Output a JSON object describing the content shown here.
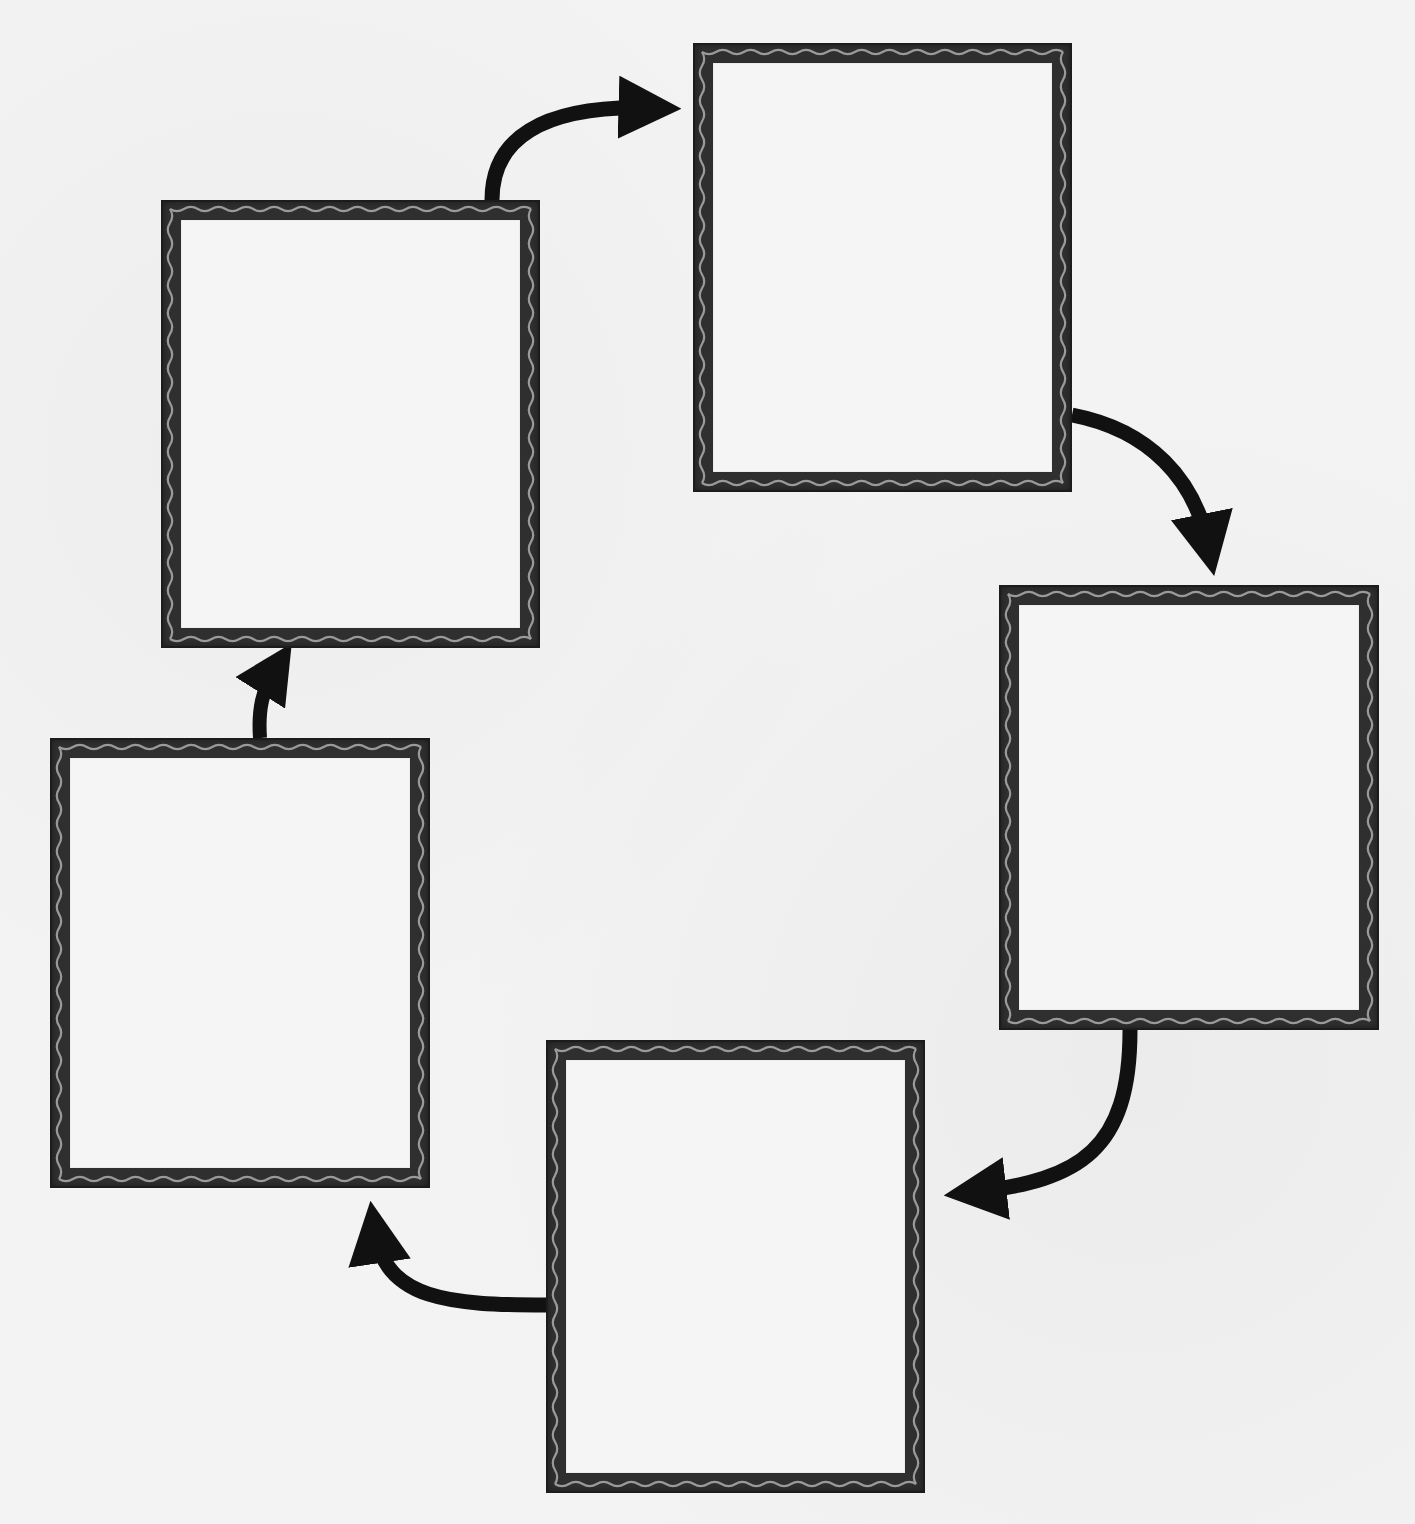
{
  "diagram": {
    "type": "cycle",
    "colors": {
      "background": "#f3f3f3",
      "frame": "#2f2f2f",
      "wave": "#9a9a9a",
      "frame_inner": "#f5f5f5",
      "arrow": "#111111"
    },
    "nodes": [
      {
        "id": "box-1",
        "label": "",
        "x": 161,
        "y": 200,
        "w": 379,
        "h": 448
      },
      {
        "id": "box-2",
        "label": "",
        "x": 693,
        "y": 43,
        "w": 379,
        "h": 449
      },
      {
        "id": "box-3",
        "label": "",
        "x": 999,
        "y": 585,
        "w": 380,
        "h": 445
      },
      {
        "id": "box-4",
        "label": "",
        "x": 546,
        "y": 1040,
        "w": 379,
        "h": 453
      },
      {
        "id": "box-5",
        "label": "",
        "x": 50,
        "y": 738,
        "w": 380,
        "h": 450
      }
    ],
    "edges": [
      {
        "from": "box-1",
        "to": "box-2"
      },
      {
        "from": "box-2",
        "to": "box-3"
      },
      {
        "from": "box-3",
        "to": "box-4"
      },
      {
        "from": "box-4",
        "to": "box-5"
      },
      {
        "from": "box-5",
        "to": "box-1"
      }
    ]
  }
}
